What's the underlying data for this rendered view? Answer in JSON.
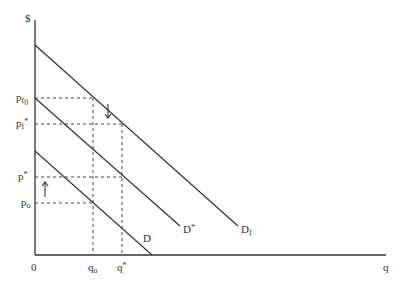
{
  "diagram": {
    "title": "",
    "axes": {
      "y_label": "$",
      "x_label": "q",
      "origin_label": "0"
    },
    "curves": [
      {
        "name": "D",
        "label": "D",
        "start": [
          35,
          151
        ],
        "end": [
          152,
          255
        ]
      },
      {
        "name": "D*",
        "label_main": "D",
        "label_sup": "*",
        "start": [
          35,
          98
        ],
        "end": [
          180,
          226
        ]
      },
      {
        "name": "Df",
        "label_main": "D",
        "label_sub": "f",
        "start": [
          35,
          45
        ],
        "end": [
          238,
          226
        ]
      }
    ],
    "price_levels": {
      "pf0": {
        "main": "p",
        "sub": "f",
        "subsub": "0",
        "y": 98
      },
      "pf_star": {
        "main": "p",
        "sub": "f",
        "sup": "*",
        "y": 124
      },
      "p_star": {
        "main": "p",
        "sup": "*",
        "y": 177
      },
      "po": {
        "main": "p",
        "sub": "o",
        "y": 203
      }
    },
    "quantity_levels": {
      "qo": {
        "main": "q",
        "sub": "o",
        "x": 93
      },
      "q_star": {
        "main": "q",
        "sup": "*",
        "x": 122
      }
    },
    "arrows": [
      {
        "direction": "down",
        "x": 108,
        "y1": 104,
        "y2": 118
      },
      {
        "direction": "up",
        "x": 45,
        "y1": 197,
        "y2": 182
      }
    ],
    "colors": {
      "line": "#333333",
      "dash": "#444444"
    }
  }
}
